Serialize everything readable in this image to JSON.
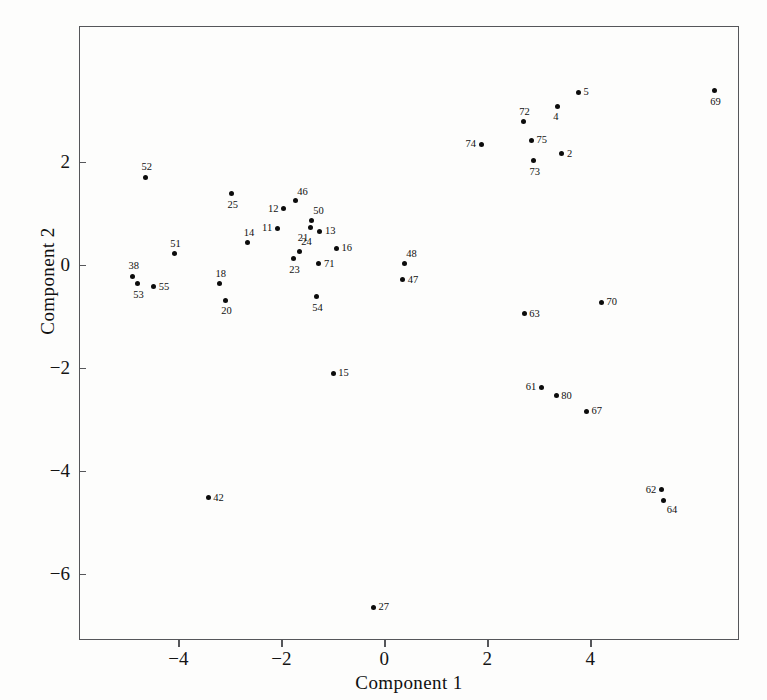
{
  "chart_data": {
    "type": "scatter",
    "title": "",
    "xlabel": "Component 1",
    "ylabel": "Component 2",
    "xlim": [
      -5.93,
      6.89
    ],
    "ylim": [
      -7.28,
      4.64
    ],
    "xticks": [
      -4,
      -2,
      0,
      2,
      4
    ],
    "xticklabels": [
      "−4",
      "−2",
      "0",
      "2",
      "4"
    ],
    "yticks": [
      2,
      0,
      -2,
      -4,
      -6
    ],
    "yticklabels": [
      "2",
      "0",
      "−2",
      "−4",
      "−6"
    ],
    "grid": false,
    "legend": null,
    "marker": "filled-circle",
    "marker_color": "#0c0c0c",
    "frame_color": "#55565a",
    "background": "#ffffff",
    "points": [
      {
        "label": "52",
        "x": -4.64,
        "y": 1.7,
        "pos": "lab-t"
      },
      {
        "label": "25",
        "x": -2.97,
        "y": 1.38,
        "pos": "lab-b"
      },
      {
        "label": "46",
        "x": -1.73,
        "y": 1.25,
        "pos": "lab-tr"
      },
      {
        "label": "12",
        "x": -1.96,
        "y": 1.09,
        "pos": "lab-l"
      },
      {
        "label": "50",
        "x": -1.42,
        "y": 0.87,
        "pos": "lab-tr"
      },
      {
        "label": "21",
        "x": -1.44,
        "y": 0.72,
        "pos": "lab-bl"
      },
      {
        "label": "11",
        "x": -2.08,
        "y": 0.71,
        "pos": "lab-l"
      },
      {
        "label": "13",
        "x": -1.25,
        "y": 0.66,
        "pos": "lab-r"
      },
      {
        "label": "14",
        "x": -2.65,
        "y": 0.43,
        "pos": "lab-t"
      },
      {
        "label": "24",
        "x": -1.65,
        "y": 0.27,
        "pos": "lab-tr"
      },
      {
        "label": "16",
        "x": -0.93,
        "y": 0.33,
        "pos": "lab-r"
      },
      {
        "label": "51",
        "x": -4.08,
        "y": 0.22,
        "pos": "lab-t"
      },
      {
        "label": "23",
        "x": -1.77,
        "y": 0.12,
        "pos": "lab-b"
      },
      {
        "label": "71",
        "x": -1.27,
        "y": 0.02,
        "pos": "lab-r"
      },
      {
        "label": "48",
        "x": 0.39,
        "y": 0.03,
        "pos": "lab-tr"
      },
      {
        "label": "38",
        "x": -4.89,
        "y": -0.22,
        "pos": "lab-t"
      },
      {
        "label": "53",
        "x": -4.8,
        "y": -0.36,
        "pos": "lab-b"
      },
      {
        "label": "18",
        "x": -3.2,
        "y": -0.36,
        "pos": "lab-t"
      },
      {
        "label": "47",
        "x": 0.36,
        "y": -0.29,
        "pos": "lab-r"
      },
      {
        "label": "55",
        "x": -4.48,
        "y": -0.42,
        "pos": "lab-r"
      },
      {
        "label": "54",
        "x": -1.32,
        "y": -0.62,
        "pos": "lab-b"
      },
      {
        "label": "20",
        "x": -3.09,
        "y": -0.68,
        "pos": "lab-b"
      },
      {
        "label": "70",
        "x": 4.22,
        "y": -0.72,
        "pos": "lab-r"
      },
      {
        "label": "63",
        "x": 2.72,
        "y": -0.95,
        "pos": "lab-r"
      },
      {
        "label": "15",
        "x": -0.99,
        "y": -2.1,
        "pos": "lab-r"
      },
      {
        "label": "61",
        "x": 3.05,
        "y": -2.37,
        "pos": "lab-l"
      },
      {
        "label": "80",
        "x": 3.34,
        "y": -2.54,
        "pos": "lab-r"
      },
      {
        "label": "67",
        "x": 3.93,
        "y": -2.84,
        "pos": "lab-r"
      },
      {
        "label": "62",
        "x": 5.38,
        "y": -4.36,
        "pos": "lab-l"
      },
      {
        "label": "64",
        "x": 5.43,
        "y": -4.57,
        "pos": "lab-br"
      },
      {
        "label": "42",
        "x": -3.42,
        "y": -4.52,
        "pos": "lab-r"
      },
      {
        "label": "27",
        "x": -0.21,
        "y": -6.64,
        "pos": "lab-r"
      },
      {
        "label": "5",
        "x": 3.77,
        "y": 3.35,
        "pos": "lab-r"
      },
      {
        "label": "69",
        "x": 6.41,
        "y": 3.38,
        "pos": "lab-b"
      },
      {
        "label": "4",
        "x": 3.36,
        "y": 3.08,
        "pos": "lab-b"
      },
      {
        "label": "72",
        "x": 2.7,
        "y": 2.78,
        "pos": "lab-t"
      },
      {
        "label": "75",
        "x": 2.86,
        "y": 2.42,
        "pos": "lab-r"
      },
      {
        "label": "74",
        "x": 1.88,
        "y": 2.34,
        "pos": "lab-l"
      },
      {
        "label": "2",
        "x": 3.45,
        "y": 2.16,
        "pos": "lab-r"
      },
      {
        "label": "73",
        "x": 2.9,
        "y": 2.02,
        "pos": "lab-b"
      }
    ]
  },
  "axes": {
    "x_title": "Component 1",
    "y_title": "Component 2"
  }
}
